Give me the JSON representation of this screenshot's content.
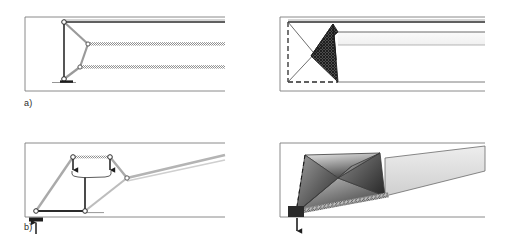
{
  "figure": {
    "background_color": "#ffffff",
    "width": 508,
    "height": 249
  },
  "panels": [
    {
      "id": "panel-a-left",
      "label": "a)",
      "position": "top-left",
      "description": "Line-drawing schematic of a triangulated linkage with pin joints at a vertical post, two struts meeting screened horizontal members running right",
      "frame": {
        "x": 25,
        "y": 17,
        "width": 200,
        "height": 74
      },
      "stroke_color": "#5a5a5a",
      "accent_color": "#2b2b2b",
      "screen_color": "#a8a8a8",
      "joints": [
        {
          "name": "top-post-joint",
          "x": 64,
          "y": 22
        },
        {
          "name": "bottom-post-joint",
          "x": 64,
          "y": 79
        },
        {
          "name": "mid-apex-joint",
          "x": 88,
          "y": 44
        },
        {
          "name": "lower-apex-joint",
          "x": 80,
          "y": 67
        }
      ],
      "members": [
        {
          "name": "vertical-post",
          "from": "top-post-joint",
          "to": "bottom-post-joint"
        },
        {
          "name": "top-chord",
          "from": "top-post-joint",
          "to": "right-edge"
        },
        {
          "name": "upper-strut",
          "from": "top-post-joint",
          "to": "mid-apex-joint"
        },
        {
          "name": "middle-screened-chord",
          "from": "mid-apex-joint",
          "to": "right-edge"
        },
        {
          "name": "diagonal-link",
          "from": "mid-apex-joint",
          "to": "lower-apex-joint"
        },
        {
          "name": "lower-screened-chord",
          "from": "lower-apex-joint",
          "to": "right-edge"
        },
        {
          "name": "bottom-strut",
          "from": "lower-apex-joint",
          "to": "bottom-post-joint"
        }
      ],
      "support": {
        "name": "ground-support",
        "x": 64,
        "y": 81,
        "type": "base-plate"
      }
    },
    {
      "id": "panel-a-right",
      "label": "",
      "position": "top-right",
      "description": "Solid rendered counterpart: dark cross-hatched wedge between dashed reference outline and a light tapered band extending right",
      "frame": {
        "x": 280,
        "y": 17,
        "width": 205,
        "height": 74
      },
      "dashed_color": "#2b2b2b",
      "wedge_fill": "#3a3a3a",
      "band_fill": "#f2f2f2",
      "outline_color": "#3a3a3a",
      "reference_outline": "dashed rectangle on left",
      "hatch": "cross-hatch"
    },
    {
      "id": "panel-b-left",
      "label": "b)",
      "position": "bottom-left",
      "description": "Deployed-state schematic: four-bar linkage with two downward load arrows, a dimension brace, pin joints and a rising screened boom; upward reaction arrow at the ground support",
      "frame": {
        "x": 25,
        "y": 143,
        "width": 200,
        "height": 74
      },
      "stroke_color": "#5a5a5a",
      "accent_color": "#2b2b2b",
      "screen_color": "#b0b0b0",
      "joints": [
        {
          "name": "left-base-joint",
          "x": 36,
          "y": 211
        },
        {
          "name": "upper-left-joint",
          "x": 73,
          "y": 157
        },
        {
          "name": "upper-right-joint",
          "x": 110,
          "y": 157
        },
        {
          "name": "mid-base-joint",
          "x": 85,
          "y": 211
        },
        {
          "name": "boom-pivot-joint",
          "x": 127,
          "y": 178
        }
      ],
      "arrows": [
        {
          "name": "load-arrow-left",
          "direction": "down",
          "x": 73,
          "y": 157
        },
        {
          "name": "load-arrow-right",
          "direction": "down",
          "x": 110,
          "y": 157
        },
        {
          "name": "brace-stem-arrow",
          "direction": "down",
          "x": 85,
          "y": 175
        },
        {
          "name": "reaction-arrow",
          "direction": "up",
          "x": 36,
          "y": 222
        }
      ],
      "brace": {
        "name": "dimension-brace",
        "from_x": 73,
        "to_x": 110,
        "y": 172
      },
      "support": {
        "name": "ground-support",
        "x": 36,
        "y": 214,
        "type": "hatched-block"
      }
    },
    {
      "id": "panel-b-right",
      "label": "",
      "position": "bottom-right",
      "description": "Solid rendered deployed state: gradient-shaded faceted polygons forming a raised boom with dashed reference edges, hatched ground strip and upward reaction arrow at dark support block",
      "frame": {
        "x": 280,
        "y": 143,
        "width": 205,
        "height": 74
      },
      "dashed_color": "#2b2b2b",
      "dark_fill": "#4a4a4a",
      "mid_fill": "#8c8c8c",
      "light_fill": "#d8d8d8",
      "band_fill": "#dcdcdc",
      "outline_color": "#3a3a3a",
      "support": {
        "name": "ground-support-block",
        "x": 292,
        "y": 214
      },
      "arrow": {
        "name": "reaction-arrow",
        "direction": "down",
        "x": 297,
        "y": 222
      }
    }
  ]
}
